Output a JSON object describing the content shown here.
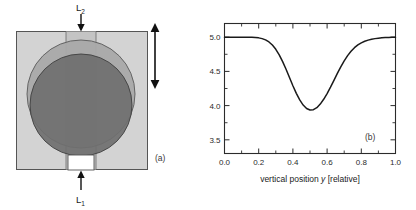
{
  "figure": {
    "panel_a": {
      "tag": "(a)",
      "label_top": "L",
      "label_top_sub": "2",
      "label_bottom": "L",
      "label_bottom_sub": "1",
      "colors": {
        "substrate": "#d2d2d2",
        "channel": "#c0c0c0",
        "upper_disc": "#a8a8a8",
        "lower_disc": "#6f6f6f",
        "notch": "#ffffff",
        "outline": "#4a4a4a",
        "arrow": "#111111"
      }
    },
    "panel_b": {
      "tag": "(b)",
      "colors": {
        "frame": "#2b2b2b",
        "curve": "#1a1a1a",
        "background": "#ffffff"
      }
    }
  },
  "chart_data": {
    "type": "line",
    "title": "",
    "xlabel": "vertical position y [relative]",
    "xlabel_parts": {
      "pre": "vertical position ",
      "italic": "y",
      "post": " [relative]"
    },
    "ylabel": "lock-in signal U_LIA [relative]",
    "ylabel_parts": {
      "pre": "lock-in signal ",
      "italic": "U",
      "sub": "LIA",
      "post": " [relative]"
    },
    "xlim": [
      0.0,
      1.0
    ],
    "ylim": [
      3.3,
      5.2
    ],
    "xticks": [
      0.0,
      0.2,
      0.4,
      0.6,
      0.8,
      1.0
    ],
    "xtick_labels": [
      "0.0",
      "0.2",
      "0.4",
      "0.6",
      "0.8",
      "1.0"
    ],
    "xminor_ticks": [
      0.1,
      0.3,
      0.5,
      0.7,
      0.9
    ],
    "yticks": [
      3.5,
      4.0,
      4.5,
      5.0
    ],
    "ytick_labels": [
      "3.5",
      "4.0",
      "4.5",
      "5.0"
    ],
    "yminor_ticks": [
      3.75,
      4.25,
      4.75
    ],
    "grid": false,
    "legend": false,
    "baseline": 5.0,
    "minimum_value": 3.9,
    "minimum_position": 0.5,
    "annotation": "(b)",
    "series": [
      {
        "name": "lock-in signal",
        "x": [
          0.0,
          0.02,
          0.04,
          0.06,
          0.08,
          0.1,
          0.12,
          0.14,
          0.16,
          0.18,
          0.2,
          0.22,
          0.24,
          0.26,
          0.28,
          0.3,
          0.32,
          0.34,
          0.36,
          0.38,
          0.4,
          0.42,
          0.44,
          0.46,
          0.48,
          0.5,
          0.52,
          0.54,
          0.56,
          0.58,
          0.6,
          0.62,
          0.64,
          0.66,
          0.68,
          0.7,
          0.72,
          0.74,
          0.76,
          0.78,
          0.8,
          0.82,
          0.84,
          0.86,
          0.88,
          0.9,
          0.92,
          0.94,
          0.96,
          0.98,
          1.0
        ],
        "values": [
          5.0,
          5.0,
          5.0,
          5.0,
          5.0,
          5.0,
          5.0,
          4.999,
          4.998,
          4.995,
          4.99,
          4.979,
          4.96,
          4.93,
          4.885,
          4.823,
          4.742,
          4.643,
          4.531,
          4.411,
          4.291,
          4.179,
          4.083,
          4.008,
          3.958,
          3.935,
          3.94,
          3.97,
          4.022,
          4.092,
          4.176,
          4.27,
          4.37,
          4.47,
          4.566,
          4.654,
          4.731,
          4.795,
          4.847,
          4.887,
          4.917,
          4.94,
          4.957,
          4.97,
          4.979,
          4.986,
          4.991,
          4.994,
          4.997,
          4.999,
          5.0
        ]
      }
    ]
  }
}
